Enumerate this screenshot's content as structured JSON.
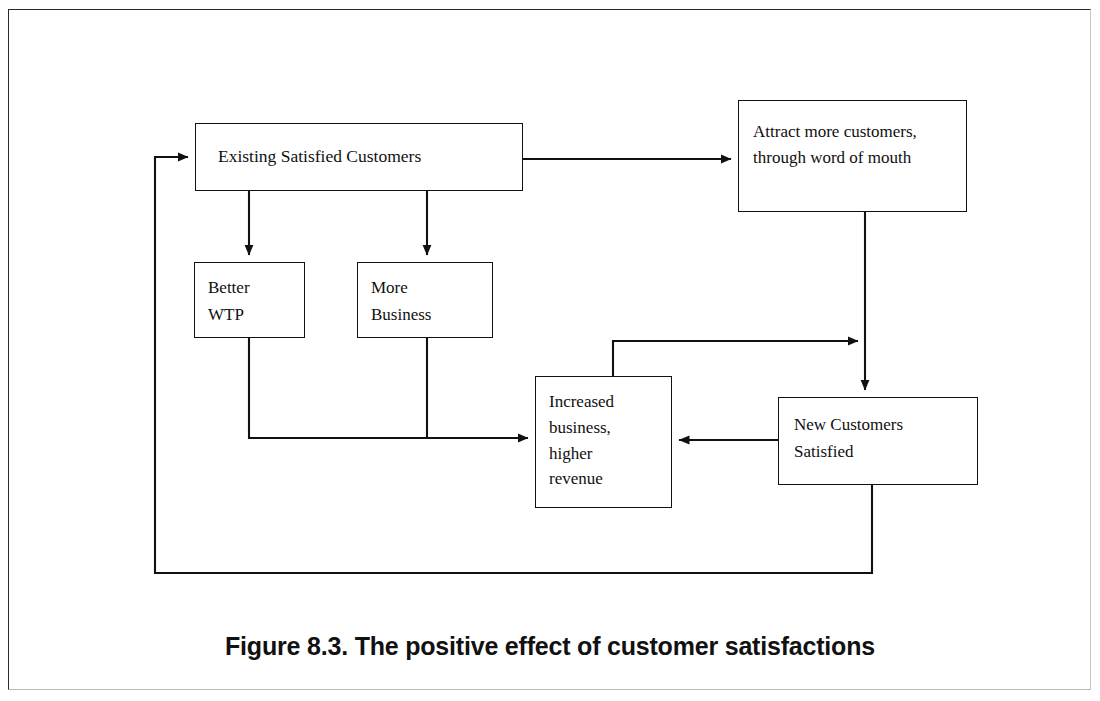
{
  "figure": {
    "caption": "Figure 8.3. The positive effect of customer satisfactions"
  },
  "diagram": {
    "type": "flowchart",
    "nodes": [
      {
        "id": "existing",
        "label": "Existing Satisfied Customers"
      },
      {
        "id": "attract",
        "label": "Attract more customers,\nthrough word of mouth"
      },
      {
        "id": "better",
        "label": "Better\nWTP"
      },
      {
        "id": "more",
        "label": "More\nBusiness"
      },
      {
        "id": "increased",
        "label": "Increased\nbusiness,\nhigher\nrevenue"
      },
      {
        "id": "newcust",
        "label": "New Customers\nSatisfied"
      }
    ],
    "edges": [
      {
        "from": "existing",
        "to": "attract",
        "label": ""
      },
      {
        "from": "existing",
        "to": "better",
        "label": ""
      },
      {
        "from": "existing",
        "to": "more",
        "label": ""
      },
      {
        "from": "better",
        "to": "increased",
        "label": ""
      },
      {
        "from": "more",
        "to": "increased",
        "label": ""
      },
      {
        "from": "attract",
        "to": "newcust",
        "label": ""
      },
      {
        "from": "increased",
        "to": "newcust",
        "label": ""
      },
      {
        "from": "newcust",
        "to": "increased",
        "label": ""
      },
      {
        "from": "newcust",
        "to": "existing",
        "label": ""
      }
    ],
    "colors": {
      "stroke": "#111111",
      "background": "#ffffff",
      "text": "#101010"
    }
  }
}
